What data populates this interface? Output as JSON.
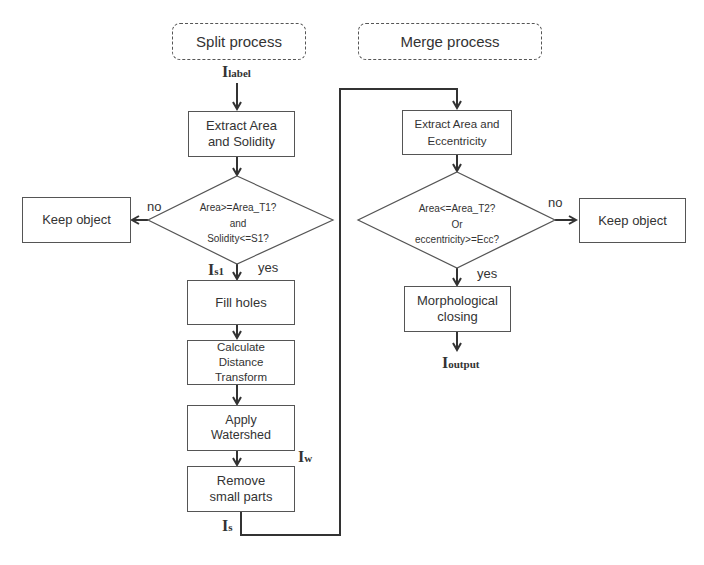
{
  "headers": {
    "split": "Split process",
    "merge": "Merge process"
  },
  "labels": {
    "i_label": {
      "main": "I",
      "sub": "label"
    },
    "i_s1": {
      "main": "I",
      "sub": "s1"
    },
    "i_w": {
      "main": "I",
      "sub": "w"
    },
    "i_s": {
      "main": "I",
      "sub": "s"
    },
    "i_output": {
      "main": "I",
      "sub": "output"
    }
  },
  "split": {
    "extract": "Extract Area and Solidity",
    "decision": [
      "Area>=Area_T1?",
      "and",
      "Solidity<=S1?"
    ],
    "no_label": "no",
    "yes_label": "yes",
    "keep": "Keep object",
    "fill": "Fill holes",
    "distance": [
      "Calculate",
      "Distance",
      "Transform"
    ],
    "watershed": [
      "Apply",
      "Watershed"
    ],
    "remove": [
      "Remove",
      "small parts"
    ]
  },
  "merge": {
    "extract": [
      "Extract Area and",
      "Eccentricity"
    ],
    "decision": [
      "Area<=Area_T2?",
      "Or",
      "eccentricity>=Ecc?"
    ],
    "no_label": "no",
    "yes_label": "yes",
    "keep": "Keep object",
    "closing": [
      "Morphological",
      "closing"
    ]
  },
  "colors": {
    "line": "#333333",
    "box_border": "#555555",
    "text": "#333333"
  }
}
